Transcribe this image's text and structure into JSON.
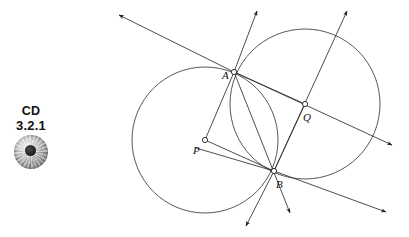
{
  "page": {
    "width": 409,
    "height": 237,
    "background": "#ffffff"
  },
  "margin_marker": {
    "name": "cd-reference",
    "label_top": "CD",
    "label_bottom": "3.2.1",
    "icon": "compact-disc-icon",
    "text_color": "#111111",
    "disc_color": "#9a9a9a",
    "disc_hole_color": "#1c1c1c"
  },
  "figure": {
    "stroke_color": "#2e2e2e",
    "curve_color": "#3a3a3a",
    "vertex_fill": "#ffffff",
    "points": [
      {
        "id": "A",
        "label": "A",
        "x": 234,
        "y": 72,
        "label_x": 222,
        "label_y": 79,
        "role": "upper-intersection"
      },
      {
        "id": "B",
        "label": "B",
        "x": 274,
        "y": 171,
        "label_x": 276,
        "label_y": 188,
        "role": "lower-intersection"
      },
      {
        "id": "P",
        "label": "P",
        "x": 205,
        "y": 140,
        "label_x": 193,
        "label_y": 154,
        "role": "left-circle-center"
      },
      {
        "id": "Q",
        "label": "Q",
        "x": 305,
        "y": 104,
        "label_x": 303,
        "label_y": 121,
        "role": "right-circle-center"
      }
    ],
    "circles": [
      {
        "id": "circle-P",
        "center": "P",
        "cx": 205,
        "cy": 140,
        "r": 73
      },
      {
        "id": "circle-Q",
        "center": "Q",
        "cx": 305,
        "cy": 104,
        "r": 75
      }
    ],
    "segments": [
      {
        "id": "segment-PA",
        "from": "P",
        "to": "A",
        "x1": 205,
        "y1": 140,
        "x2": 234,
        "y2": 72
      },
      {
        "id": "segment-PB",
        "from": "P",
        "to": "B",
        "x1": 205,
        "y1": 140,
        "x2": 274,
        "y2": 171
      },
      {
        "id": "segment-QA",
        "from": "Q",
        "to": "A",
        "x1": 305,
        "y1": 104,
        "x2": 234,
        "y2": 72
      },
      {
        "id": "segment-QB",
        "from": "Q",
        "to": "B",
        "x1": 305,
        "y1": 104,
        "x2": 274,
        "y2": 171
      }
    ],
    "rays": [
      {
        "id": "ray-A-upper-left",
        "from": "A",
        "x1": 234,
        "y1": 72,
        "x2": 119,
        "y2": 15,
        "arrow": "end"
      },
      {
        "id": "ray-A-upper-right",
        "from": "A",
        "x1": 234,
        "y1": 72,
        "x2": 257,
        "y2": 11,
        "arrow": "end"
      },
      {
        "id": "ray-A-through-Q",
        "from": "A",
        "x1": 234,
        "y1": 72,
        "x2": 392,
        "y2": 145,
        "arrow": "end"
      },
      {
        "id": "ray-A-through-B",
        "from": "A",
        "x1": 234,
        "y1": 72,
        "x2": 290,
        "y2": 213,
        "arrow": "end"
      },
      {
        "id": "ray-B-through-Q",
        "from": "B",
        "x1": 274,
        "y1": 171,
        "x2": 347,
        "y2": 11,
        "arrow": "end"
      },
      {
        "id": "ray-B-lower-left",
        "from": "B",
        "x1": 274,
        "y1": 171,
        "x2": 246,
        "y2": 226,
        "arrow": "end"
      },
      {
        "id": "ray-B-lower-right",
        "from": "B",
        "x1": 274,
        "y1": 171,
        "x2": 386,
        "y2": 212,
        "arrow": "end"
      },
      {
        "id": "ray-B-upper-left",
        "from": "B",
        "x1": 274,
        "y1": 171,
        "x2": 196,
        "y2": 148,
        "arrow": "none"
      }
    ]
  }
}
